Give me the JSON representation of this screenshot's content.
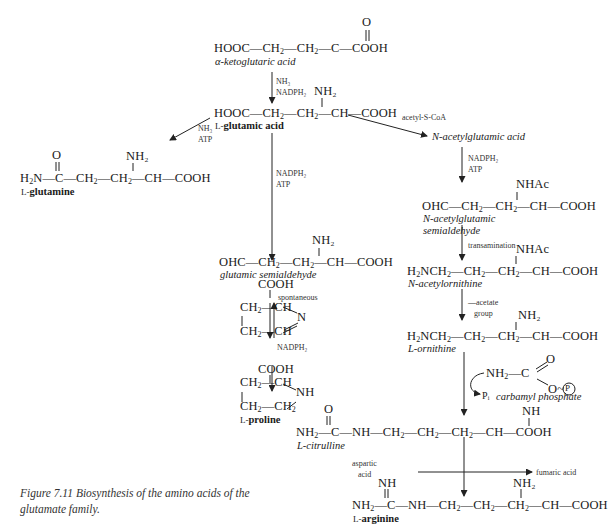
{
  "compounds": {
    "aketo": {
      "formula_left": "HOOC—CH",
      "formula_mid": "—CH",
      "formula_right": "—C—COOH",
      "top": "O",
      "name": "α-ketoglutaric acid"
    },
    "glu": {
      "formula": "HOOC—CH₂—CH₂—CH—COOH",
      "top": "NH₂",
      "name_prefix": "L-",
      "name": "glutamic acid"
    },
    "gln": {
      "formula": "H₂N—C—CH₂—CH₂—CH—COOH",
      "top_o": "O",
      "top_nh2": "NH₂",
      "name_prefix": "L-",
      "name": "glutamine"
    },
    "nag": {
      "name": "N-acetylglutamic acid"
    },
    "gsa": {
      "formula": "OHC—CH₂—CH₂—CH—COOH",
      "top": "NH₂",
      "name": "glutamic semialdehyde"
    },
    "nags": {
      "formula": "OHC—CH₂—CH₂—CH—COOH",
      "top": "NHAc",
      "name_line1": "N-acetylglutamic",
      "name_line2": "semialdehyde"
    },
    "naorn": {
      "formula": "H₂NCH₂—CH₂—CH₂—CH—COOH",
      "top": "NHAc",
      "name": "N-acetylornithine"
    },
    "orn": {
      "formula": "H₂NCH₂—CH₂—CH₂—CH—COOH",
      "top": "NH₂",
      "name": "L-ornithine"
    },
    "p5c": {
      "cooh": "COOH",
      "row1": "CH₂—CH",
      "row2": "CH₂—CH",
      "n": "N"
    },
    "pro": {
      "cooh": "COOH",
      "row1": "CH₂—CH",
      "row2": "CH₂—CH₂",
      "nh": "NH",
      "name_prefix": "L-",
      "name": "proline"
    },
    "carbp": {
      "formula": "NH₂—C",
      "o_top": "O",
      "o_bottom": "O~",
      "p": "P",
      "pi": "Pᵢ",
      "name": "carbamyl phosphate"
    },
    "cit": {
      "formula": "NH₂—C—NH—CH₂—CH₂—CH₂—CH—COOH",
      "top_o": "O",
      "top_nh": "NH",
      "name": "L-citrulline"
    },
    "arg": {
      "formula": "NH₂—C—NH—CH₂—CH₂—CH₂—CH—COOH",
      "top_nh": "NH",
      "top_nh2": "NH₂",
      "name_prefix": "L-",
      "name": "arginine"
    }
  },
  "reagents": {
    "aketo_to_glu": [
      "NH₃",
      "NADPH₂"
    ],
    "glu_to_gln": [
      "NH₃",
      "ATP"
    ],
    "glu_to_nag": "acetyl-S-CoA",
    "glu_to_gsa": [
      "NADPH₂",
      "ATP"
    ],
    "nag_to_nags": [
      "NADPH₂",
      "ATP"
    ],
    "gsa_to_p5c": "spontaneous",
    "nags_to_naorn": "transamination",
    "p5c_to_pro": "NADPH₂",
    "naorn_to_orn": [
      "—acetate",
      "group"
    ],
    "cit_to_arg_in": [
      "aspartic",
      "acid"
    ],
    "cit_to_arg_out": "fumaric acid"
  },
  "caption": {
    "line1": "Figure 7.11  Biosynthesis of the amino acids of the",
    "line2": "glutamate family."
  }
}
